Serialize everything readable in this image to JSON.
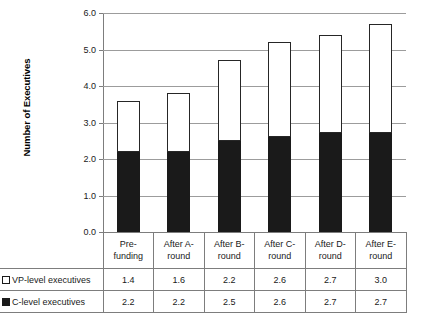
{
  "chart_data": {
    "type": "bar",
    "stacked": true,
    "title": "",
    "xlabel": "",
    "ylabel": "Number of Executives",
    "ylim": [
      0.0,
      6.0
    ],
    "ytick_step": 1.0,
    "ytick_labels": [
      "6.0",
      "5.0",
      "4.0",
      "3.0",
      "2.0",
      "1.0",
      "0.0"
    ],
    "ytick_values": [
      6.0,
      5.0,
      4.0,
      3.0,
      2.0,
      1.0,
      0.0
    ],
    "grid": true,
    "legend_position": "data-table-left-column",
    "categories": [
      "Pre-funding",
      "After A-round",
      "After B-round",
      "After C-round",
      "After D-round",
      "After E-round"
    ],
    "category_lines": [
      [
        "Pre-",
        "funding"
      ],
      [
        "After A-",
        "round"
      ],
      [
        "After B-",
        "round"
      ],
      [
        "After C-",
        "round"
      ],
      [
        "After D-",
        "round"
      ],
      [
        "After E-",
        "round"
      ]
    ],
    "series": [
      {
        "name": "VP-level executives",
        "color": "#ffffff",
        "border_color": "#262626",
        "values": [
          1.4,
          1.6,
          2.2,
          2.6,
          2.7,
          3.0
        ],
        "labels": [
          "1.4",
          "1.6",
          "2.2",
          "2.6",
          "2.7",
          "3.0"
        ]
      },
      {
        "name": "C-level executives",
        "color": "#1a1a1a",
        "border_color": "#1a1a1a",
        "values": [
          2.2,
          2.2,
          2.5,
          2.6,
          2.7,
          2.7
        ],
        "labels": [
          "2.2",
          "2.2",
          "2.5",
          "2.6",
          "2.7",
          "2.7"
        ]
      }
    ],
    "totals": [
      3.6,
      3.8,
      4.7,
      5.2,
      5.4,
      5.7
    ],
    "stack_order_bottom_to_top": [
      "C-level executives",
      "VP-level executives"
    ]
  },
  "table": {
    "rows": [
      {
        "legend_marker": "square-outline-icon",
        "label": "VP-level executives",
        "values": [
          "1.4",
          "1.6",
          "2.2",
          "2.6",
          "2.7",
          "3.0"
        ]
      },
      {
        "legend_marker": "square-filled-icon",
        "label": "C-level executives",
        "values": [
          "2.2",
          "2.2",
          "2.5",
          "2.6",
          "2.7",
          "2.7"
        ]
      }
    ]
  },
  "colors": {
    "vp_fill": "#ffffff",
    "vp_border": "#262626",
    "c_fill": "#1a1a1a",
    "gridline": "#9c9c9c",
    "axis": "#7d7d7d",
    "background": "#ffffff"
  }
}
